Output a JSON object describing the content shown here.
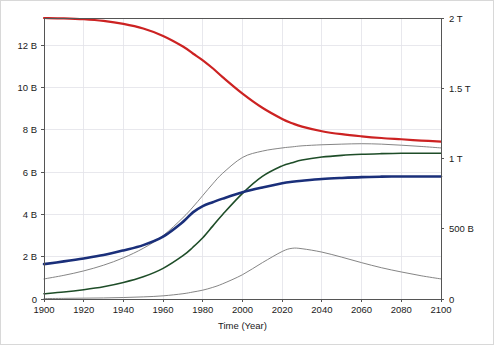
{
  "chart_data": {
    "type": "line",
    "title": "",
    "xlabel": "Time (Year)",
    "ylabel": "",
    "xlim": [
      1900,
      2100
    ],
    "ylim": [
      0,
      13.3
    ],
    "y2lim": [
      0,
      2000
    ],
    "grid": true,
    "legend": "none",
    "x_ticks": [
      1900,
      1920,
      1940,
      1960,
      1980,
      2000,
      2020,
      2040,
      2060,
      2080,
      2100
    ],
    "x_tick_labels": [
      "1900",
      "1920",
      "1940",
      "1960",
      "1980",
      "2000",
      "2020",
      "2040",
      "2060",
      "2080",
      "2100"
    ],
    "y_ticks": [
      0,
      2,
      4,
      6,
      8,
      10,
      12
    ],
    "y_tick_labels": [
      "0",
      "2 B",
      "4 B",
      "6 B",
      "8 B",
      "10 B",
      "12 B"
    ],
    "y2_ticks": [
      0,
      500,
      1000,
      1500,
      2000
    ],
    "y2_tick_labels": [
      "0",
      "500 B",
      "1 T",
      "1.5 T",
      "2 T"
    ],
    "x": [
      1900,
      1910,
      1920,
      1930,
      1940,
      1950,
      1960,
      1970,
      1975,
      1980,
      1985,
      1990,
      2000,
      2010,
      2020,
      2025,
      2030,
      2040,
      2050,
      2060,
      2070,
      2080,
      2090,
      2100
    ],
    "series": [
      {
        "name": "resources",
        "axis": "right",
        "color": "#cc2222",
        "width": 2.2,
        "values_left_scale": [
          13.3,
          13.28,
          13.24,
          13.16,
          13.02,
          12.8,
          12.45,
          11.95,
          11.62,
          11.3,
          10.92,
          10.5,
          9.72,
          9.05,
          8.52,
          8.32,
          8.16,
          7.94,
          7.8,
          7.7,
          7.62,
          7.56,
          7.5,
          7.45
        ],
        "values_right": [
          2000,
          1997,
          1991,
          1979,
          1958,
          1925,
          1872,
          1797,
          1748,
          1699,
          1642,
          1579,
          1462,
          1361,
          1281,
          1251,
          1227,
          1194,
          1173,
          1158,
          1146,
          1137,
          1128,
          1120
        ]
      },
      {
        "name": "industrial-output",
        "axis": "left",
        "color": "#777777",
        "width": 0.9,
        "values_left_scale": [
          0.95,
          1.12,
          1.33,
          1.6,
          1.95,
          2.4,
          3.0,
          3.85,
          4.35,
          4.9,
          5.45,
          5.95,
          6.7,
          7.0,
          7.15,
          7.2,
          7.25,
          7.3,
          7.33,
          7.35,
          7.33,
          7.28,
          7.22,
          7.15
        ]
      },
      {
        "name": "food",
        "axis": "left",
        "color": "#1e4d28",
        "width": 1.6,
        "values_left_scale": [
          0.25,
          0.33,
          0.44,
          0.58,
          0.78,
          1.05,
          1.45,
          2.05,
          2.45,
          2.9,
          3.45,
          4.0,
          5.0,
          5.8,
          6.3,
          6.45,
          6.58,
          6.72,
          6.8,
          6.85,
          6.88,
          6.9,
          6.9,
          6.9
        ]
      },
      {
        "name": "population",
        "axis": "left",
        "color": "#1a2f7a",
        "width": 2.6,
        "values_left_scale": [
          1.65,
          1.78,
          1.92,
          2.08,
          2.3,
          2.55,
          2.95,
          3.65,
          4.1,
          4.4,
          4.58,
          4.75,
          5.05,
          5.28,
          5.48,
          5.55,
          5.6,
          5.68,
          5.73,
          5.77,
          5.79,
          5.8,
          5.8,
          5.8
        ]
      },
      {
        "name": "pollution",
        "axis": "left",
        "color": "#777777",
        "width": 0.9,
        "values_left_scale": [
          0.02,
          0.03,
          0.04,
          0.05,
          0.07,
          0.1,
          0.15,
          0.25,
          0.33,
          0.42,
          0.55,
          0.72,
          1.15,
          1.72,
          2.25,
          2.4,
          2.38,
          2.22,
          1.98,
          1.72,
          1.48,
          1.28,
          1.1,
          0.95
        ]
      }
    ]
  },
  "axes": {
    "plot_left_px": 43,
    "plot_right_px": 440,
    "plot_top_px": 17,
    "plot_bottom_px": 298
  },
  "colors": {
    "frame": "#555555",
    "grid": "#e2e2e8",
    "background": "#ffffff",
    "text": "#1a1a1a"
  }
}
